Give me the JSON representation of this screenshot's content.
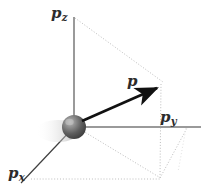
{
  "figure": {
    "type": "3d-vector-diagram",
    "width": 204,
    "height": 192,
    "background_color": "#ffffff"
  },
  "labels": {
    "z_axis": {
      "base": "p",
      "sub": "z",
      "name": "p-z-axis-label"
    },
    "y_axis": {
      "base": "p",
      "sub": "y",
      "name": "p-y-axis-label"
    },
    "x_axis": {
      "base": "p",
      "sub": "x",
      "name": "p-x-axis-label"
    },
    "vector": {
      "base": "p",
      "sub": "",
      "name": "momentum-vector-label"
    }
  },
  "colors": {
    "axis": "#9a9a9a",
    "axis_x": "#3a3a3a",
    "vector": "#111111",
    "projection_dotted": "#bdbdbd",
    "sphere_dark": "#4b4b4b",
    "sphere_light": "#d6d6d6",
    "blur_trail": "#e3e3e3",
    "text": "#2b2b2b"
  },
  "geometry": {
    "origin": {
      "x": 74,
      "y": 127
    },
    "z_axis_top": {
      "x": 74,
      "y": 17
    },
    "y_axis_end": {
      "x": 201,
      "y": 127
    },
    "x_axis_end": {
      "x": 21,
      "y": 183
    },
    "vector_tip": {
      "x": 164,
      "y": 83
    },
    "box_corner_bottom": {
      "x": 160,
      "y": 178
    },
    "box_corner_right": {
      "x": 186,
      "y": 128
    },
    "dotted_horizontal_y": 178,
    "dotted_horizontal_x_start": 31,
    "sphere": {
      "cx": 74,
      "cy": 127,
      "r": 12
    },
    "blur_trail_end": {
      "x": 42,
      "y": 137
    }
  },
  "elements": {
    "z_axis": "vertical-axis-line",
    "y_axis": "horizontal-axis-line",
    "x_axis": "depth-axis-line",
    "vector_arrow": "momentum-vector-arrow",
    "particle": "particle-sphere",
    "motion_blur": "motion-blur-trail",
    "projection_lines": "projection-dotted-lines"
  }
}
